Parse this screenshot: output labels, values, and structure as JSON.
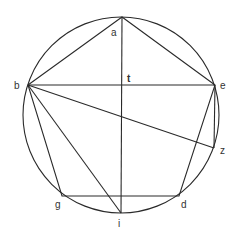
{
  "diagram": {
    "type": "geometry",
    "circle": {
      "cx": 121,
      "cy": 115,
      "r": 98
    },
    "points": {
      "a": {
        "x": 122,
        "y": 17
      },
      "b": {
        "x": 28,
        "y": 85
      },
      "e": {
        "x": 215,
        "y": 85
      },
      "z": {
        "x": 214,
        "y": 148
      },
      "d": {
        "x": 179,
        "y": 196
      },
      "i": {
        "x": 121,
        "y": 213
      },
      "g": {
        "x": 62,
        "y": 196
      },
      "t": {
        "x": 122,
        "y": 85
      }
    },
    "labels": {
      "a": "a",
      "b": "b",
      "e": "e",
      "t": "t",
      "z": "z",
      "g": "g",
      "d": "d",
      "i": "i"
    },
    "stroke_color": "#2a2a2a"
  }
}
